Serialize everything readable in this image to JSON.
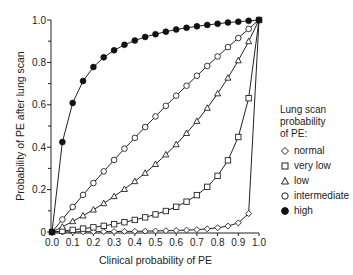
{
  "chart_data": {
    "type": "line",
    "title": "",
    "xlabel": "Clinical probability of PE",
    "ylabel": "Probability of PE after lung scan",
    "xlim": [
      0,
      1
    ],
    "ylim": [
      0,
      1
    ],
    "grid": false,
    "legend_position": "right",
    "legend_title": "Lung scan probability of PE:",
    "x_ticks": [
      "0.0",
      "0.1",
      "0.2",
      "0.3",
      "0.4",
      "0.5",
      "0.6",
      "0.7",
      "0.8",
      "0.9",
      "1.0"
    ],
    "y_ticks": [
      "0",
      "0.2",
      "0.4",
      "0.6",
      "0.8",
      "1.0"
    ],
    "x": [
      0,
      0.05,
      0.1,
      0.15,
      0.2,
      0.25,
      0.3,
      0.35,
      0.4,
      0.45,
      0.5,
      0.55,
      0.6,
      0.65,
      0.7,
      0.75,
      0.8,
      0.85,
      0.9,
      0.95,
      1.0
    ],
    "series": [
      {
        "name": "normal",
        "marker": "diamond",
        "values": [
          0,
          0.0003,
          0.0006,
          0.0009,
          0.0013,
          0.0017,
          0.002,
          0.003,
          0.003,
          0.004,
          0.005,
          0.006,
          0.007,
          0.009,
          0.011,
          0.015,
          0.02,
          0.028,
          0.043,
          0.087,
          1.0
        ]
      },
      {
        "name": "very low",
        "marker": "square",
        "values": [
          0,
          0.005,
          0.01,
          0.016,
          0.022,
          0.029,
          0.037,
          0.046,
          0.057,
          0.069,
          0.083,
          0.099,
          0.119,
          0.143,
          0.174,
          0.213,
          0.265,
          0.338,
          0.448,
          0.631,
          1.0
        ]
      },
      {
        "name": "low",
        "marker": "triangle",
        "values": [
          0,
          0.024,
          0.05,
          0.077,
          0.105,
          0.135,
          0.168,
          0.202,
          0.239,
          0.278,
          0.32,
          0.365,
          0.413,
          0.466,
          0.523,
          0.585,
          0.653,
          0.727,
          0.809,
          0.899,
          1.0
        ]
      },
      {
        "name": "intermediate",
        "marker": "circle",
        "values": [
          0,
          0.059,
          0.118,
          0.175,
          0.231,
          0.286,
          0.34,
          0.393,
          0.444,
          0.495,
          0.545,
          0.595,
          0.643,
          0.69,
          0.737,
          0.783,
          0.828,
          0.872,
          0.915,
          0.958,
          1.0
        ]
      },
      {
        "name": "high",
        "marker": "filled-circle",
        "values": [
          0,
          0.424,
          0.609,
          0.712,
          0.778,
          0.824,
          0.857,
          0.883,
          0.903,
          0.92,
          0.933,
          0.945,
          0.955,
          0.963,
          0.97,
          0.977,
          0.982,
          0.988,
          0.992,
          0.996,
          1.0
        ]
      }
    ]
  },
  "legend": {
    "title_lines": [
      "Lung scan",
      "probability",
      "of PE:"
    ],
    "items": [
      {
        "label": "normal",
        "marker": "diamond"
      },
      {
        "label": "very low",
        "marker": "square"
      },
      {
        "label": "low",
        "marker": "triangle"
      },
      {
        "label": "intermediate",
        "marker": "circle"
      },
      {
        "label": "high",
        "marker": "filled-circle"
      }
    ]
  },
  "colors": {
    "line": "#222222",
    "background": "#ffffff"
  }
}
